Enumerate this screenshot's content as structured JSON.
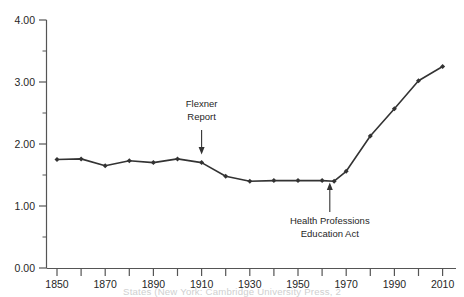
{
  "chart_data": {
    "type": "line",
    "title": "",
    "subtitle": "",
    "xlabel": "",
    "ylabel": "",
    "xlim": [
      1845,
      2015
    ],
    "ylim": [
      0.0,
      4.0
    ],
    "grid": false,
    "legend": null,
    "legend_position": "none",
    "x": [
      1850,
      1860,
      1870,
      1880,
      1890,
      1900,
      1910,
      1920,
      1930,
      1940,
      1950,
      1960,
      1965,
      1970,
      1980,
      1990,
      2000,
      2010
    ],
    "values": [
      1.75,
      1.76,
      1.65,
      1.73,
      1.7,
      1.76,
      1.7,
      1.48,
      1.4,
      1.41,
      1.41,
      1.41,
      1.4,
      1.56,
      2.13,
      2.57,
      3.02,
      3.25
    ],
    "series": [
      {
        "name": "series-1",
        "values": [
          1.75,
          1.76,
          1.65,
          1.73,
          1.7,
          1.76,
          1.7,
          1.48,
          1.4,
          1.41,
          1.41,
          1.41,
          1.4,
          1.56,
          2.13,
          2.57,
          3.02,
          3.25
        ]
      }
    ],
    "y_ticks": [
      0.0,
      1.0,
      2.0,
      3.0,
      4.0
    ],
    "y_tick_labels": [
      "0.00",
      "1.00",
      "2.00",
      "3.00",
      "4.00"
    ],
    "y_minor_ticks": [
      0.5,
      1.5,
      2.5,
      3.5
    ],
    "x_ticks": [
      1850,
      1860,
      1870,
      1880,
      1890,
      1900,
      1910,
      1920,
      1930,
      1940,
      1950,
      1960,
      1970,
      1980,
      1990,
      2000,
      2010
    ],
    "x_tick_labels": [
      "1850",
      "",
      "1870",
      "",
      "1890",
      "",
      "1910",
      "",
      "1930",
      "",
      "1950",
      "",
      "1970",
      "",
      "1990",
      "",
      "2010"
    ],
    "x_labeled_ticks": [
      {
        "value": 1850,
        "label": "1850"
      },
      {
        "value": 1870,
        "label": "1870"
      },
      {
        "value": 1890,
        "label": "1890"
      },
      {
        "value": 1910,
        "label": "1910"
      },
      {
        "value": 1930,
        "label": "1930"
      },
      {
        "value": 1950,
        "label": "1950"
      },
      {
        "value": 1970,
        "label": "1970"
      },
      {
        "value": 1990,
        "label": "1990"
      },
      {
        "value": 2010,
        "label": "2010"
      }
    ],
    "annotations": [
      {
        "id": "flexner-report",
        "label_line_1": "Flexner",
        "label_line_2": "Report",
        "x": 1910,
        "arrow_direction": "down",
        "arrow_from_y": 2.48,
        "arrow_to_y": 1.82
      },
      {
        "id": "health-professions-education-act",
        "label_line_1": "Health Professions",
        "label_line_2": "Education Act",
        "x": 1965,
        "arrow_direction": "up",
        "arrow_from_y": 0.72,
        "arrow_to_y": 1.32
      }
    ],
    "marker": "filled-diamond",
    "line_color": "#333333",
    "axis_color": "#555555"
  },
  "axis": {
    "y_labels": {
      "t0": "0.00",
      "t1": "1.00",
      "t2": "2.00",
      "t3": "3.00",
      "t4": "4.00"
    },
    "x_labels": {
      "t1850": "1850",
      "t1870": "1870",
      "t1890": "1890",
      "t1910": "1910",
      "t1930": "1930",
      "t1950": "1950",
      "t1970": "1970",
      "t1990": "1990",
      "t2010": "2010"
    }
  },
  "annotations": {
    "flexner": {
      "line1": "Flexner",
      "line2": "Report"
    },
    "hpea": {
      "line1": "Health Professions",
      "line2": "Education Act"
    }
  },
  "caption": {
    "cut_off_source_line": "States (New York: Cambridge University Press, 2"
  }
}
